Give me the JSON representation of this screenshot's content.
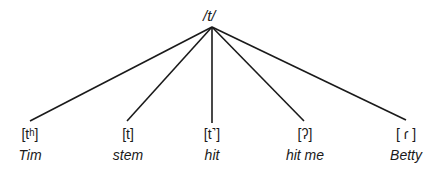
{
  "diagram": {
    "root": {
      "label": "/t/",
      "x": 212,
      "y": 27
    },
    "allophones": [
      {
        "phone": "[tʰ]",
        "example": "Tim",
        "x": 30,
        "end_x": 30,
        "end_y": 121
      },
      {
        "phone": "[t]",
        "example": "stem",
        "x": 128,
        "end_x": 127,
        "end_y": 121
      },
      {
        "phone": "[t˺]",
        "example": "hit",
        "x": 212,
        "end_x": 212,
        "end_y": 123
      },
      {
        "phone": "[ʔ]",
        "example": "hit me",
        "x": 305,
        "end_x": 304,
        "end_y": 121
      },
      {
        "phone": "[ ɾ ]",
        "example": "Betty",
        "x": 406,
        "end_x": 406,
        "end_y": 120
      }
    ],
    "line_color": "#1a1a1a"
  }
}
